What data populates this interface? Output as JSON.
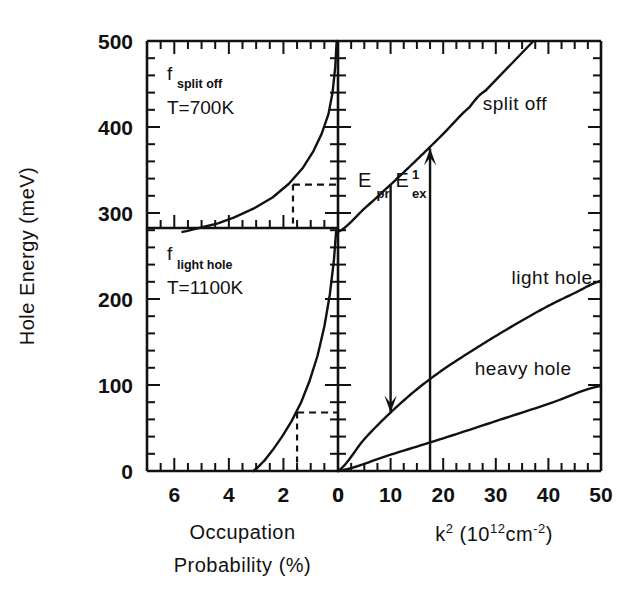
{
  "figure": {
    "background_color": "#ffffff",
    "line_color": "#111111",
    "y_axis_title": "Hole Energy (meV)",
    "y_ticks": [
      "0",
      "100",
      "200",
      "300",
      "400",
      "500"
    ],
    "y_tick_values": [
      0,
      100,
      200,
      300,
      400,
      500
    ],
    "y_range": [
      0,
      500
    ],
    "y_minor_step": 20
  },
  "left_panel": {
    "x_axis_title_line1": "Occupation",
    "x_axis_title_line2": "Probability (%)",
    "x_ticks": [
      "6",
      "4",
      "2",
      "0"
    ],
    "x_tick_values": [
      6,
      4,
      2,
      0
    ],
    "x_range": [
      7,
      0
    ],
    "x_minor_step": 0.5,
    "annotations": [
      {
        "name": "split-off-distribution-label",
        "symbol": "f",
        "subscript": "split off",
        "temperature": "T=700K"
      },
      {
        "name": "light-hole-distribution-label",
        "symbol": "f",
        "subscript": "light hole",
        "temperature": "T=1100K"
      }
    ],
    "divider_energy": 278,
    "guide_lines": [
      {
        "name": "split-off-guide",
        "energy": 333,
        "probability": 1.65
      },
      {
        "name": "light-hole-guide",
        "energy": 68,
        "probability": 1.5
      }
    ]
  },
  "right_panel": {
    "x_axis_title": "k² (10¹² cm⁻²)",
    "x_axis_title_parts": {
      "k": "k",
      "k_exponent": "2",
      "open": "(10",
      "ten_exponent": "12",
      "cm": "cm",
      "cm_exponent": "-2",
      "close": ")"
    },
    "x_ticks": [
      "0",
      "10",
      "20",
      "30",
      "40",
      "50"
    ],
    "x_tick_values": [
      0,
      10,
      20,
      30,
      40,
      50
    ],
    "x_range": [
      0,
      50
    ],
    "x_minor_step": 2.5,
    "band_labels": [
      {
        "name": "split-off-band-label",
        "text": "split off"
      },
      {
        "name": "light-hole-band-label",
        "text": "light hole"
      },
      {
        "name": "heavy-hole-band-label",
        "text": "heavy hole"
      }
    ],
    "arrows": [
      {
        "name": "probe-transition-arrow",
        "symbol": "E",
        "subscript": "pr",
        "superscript": "",
        "k2": 10.0,
        "from_energy": 333,
        "to_energy": 68,
        "direction": "down"
      },
      {
        "name": "excitation-transition-arrow",
        "symbol": "E",
        "subscript": "ex",
        "superscript": "1",
        "k2": 17.5,
        "from_energy": 0,
        "to_energy": 375,
        "direction": "up"
      }
    ]
  },
  "chart_data": {
    "type": "line",
    "title": "",
    "xlabel": "k² (10¹² cm⁻²)  /  Occupation Probability (%)",
    "ylabel": "Hole Energy (meV)",
    "ylim": [
      0,
      500
    ],
    "panels": [
      {
        "name": "occupation-probability-panel",
        "position": "left",
        "xlabel": "Occupation Probability (%)",
        "xlim": [
          7,
          0
        ],
        "xticks": [
          6,
          4,
          2,
          0
        ],
        "series": [
          {
            "name": "f_split_off (T=700K)",
            "x": [
              0.05,
              0.1,
              0.2,
              0.35,
              0.6,
              0.9,
              1.3,
              1.8,
              2.4,
              3.1,
              3.8,
              4.4,
              4.9,
              5.3,
              5.55,
              5.7
            ],
            "y": [
              500,
              470,
              440,
              415,
              392,
              372,
              352,
              334,
              318,
              305,
              295,
              288,
              284,
              281,
              279,
              278
            ]
          },
          {
            "name": "f_light_hole (T=1100K)",
            "x": [
              0.07,
              0.15,
              0.3,
              0.5,
              0.75,
              1.05,
              1.35,
              1.7,
              2.05,
              2.4,
              2.7,
              2.95,
              3.1
            ],
            "y": [
              278,
              245,
              205,
              168,
              134,
              104,
              80,
              58,
              40,
              24,
              12,
              4,
              0
            ]
          }
        ],
        "guides": [
          {
            "name": "split-off-guide-line",
            "energy": 333,
            "probability": 1.65,
            "style": "dashed"
          },
          {
            "name": "light-hole-guide-line",
            "energy": 68,
            "probability": 1.5,
            "style": "dashed"
          }
        ]
      },
      {
        "name": "band-dispersion-panel",
        "position": "right",
        "xlabel": "k² (10¹² cm⁻²)",
        "xlim": [
          0,
          50
        ],
        "xticks": [
          0,
          10,
          20,
          30,
          40,
          50
        ],
        "series": [
          {
            "name": "split off",
            "x": [
              0,
              5,
              10,
              15,
              20,
              25,
              28
            ],
            "y": [
              278,
              305,
              333,
              362,
              392,
              423,
              442
            ]
          },
          {
            "name": "light hole",
            "x": [
              0,
              5,
              10,
              15,
              20,
              25,
              30,
              35,
              40,
              45,
              50
            ],
            "y": [
              0,
              37,
              68,
              95,
              118,
              138,
              157,
              175,
              192,
              207,
              221
            ]
          },
          {
            "name": "heavy hole",
            "x": [
              0,
              10,
              20,
              30,
              40,
              50
            ],
            "y": [
              0,
              19,
              38,
              58,
              78,
              99
            ]
          }
        ],
        "annotations": [
          {
            "name": "E_pr",
            "label": "E_pr",
            "k2": 10.0,
            "y_start": 333,
            "y_end": 68
          },
          {
            "name": "E_ex_1",
            "label": "E^1_ex",
            "k2": 17.5,
            "y_start": 0,
            "y_end": 375
          }
        ]
      }
    ]
  }
}
